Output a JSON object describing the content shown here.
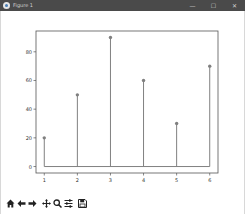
{
  "window": {
    "title": "Figure 1",
    "controls": {
      "minimize": "—",
      "maximize": "☐",
      "close": "✕"
    }
  },
  "toolbar": {
    "home": "home-icon",
    "back": "back-arrow-icon",
    "forward": "forward-arrow-icon",
    "pan": "pan-icon",
    "zoom": "zoom-icon",
    "configure": "configure-subplots-icon",
    "save": "save-icon"
  },
  "chart_data": {
    "type": "stem",
    "title": "",
    "xlabel": "",
    "ylabel": "",
    "x": [
      1,
      2,
      3,
      4,
      5,
      6
    ],
    "values": [
      20,
      50,
      90,
      60,
      30,
      70
    ],
    "x_ticks": [
      "1",
      "2",
      "3",
      "4",
      "5",
      "6"
    ],
    "y_ticks": [
      "0",
      "20",
      "40",
      "60",
      "80"
    ],
    "xlim": [
      0.75,
      6.25
    ],
    "ylim": [
      -4.5,
      94.5
    ],
    "grid": false,
    "baseline": 0,
    "line_color": "#808080",
    "marker_color": "#808080"
  }
}
